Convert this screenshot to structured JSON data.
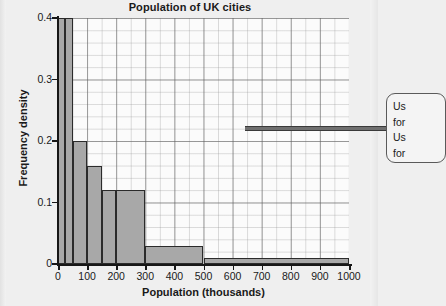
{
  "chart_data": {
    "type": "bar",
    "title": "Population of UK cities",
    "xlabel": "Population (thousands)",
    "ylabel": "Frequency density",
    "xlim": [
      0,
      1000
    ],
    "ylim": [
      0,
      0.4
    ],
    "grid": true,
    "legend": "none",
    "xticks": [
      "0",
      "100",
      "200",
      "300",
      "400",
      "500",
      "600",
      "700",
      "800",
      "900",
      "1000"
    ],
    "xtick_values": [
      0,
      100,
      200,
      300,
      400,
      500,
      600,
      700,
      800,
      900,
      1000
    ],
    "yticks": [
      "0",
      "0.1",
      "0.2",
      "0.3",
      "0.4"
    ],
    "ytick_values": [
      0,
      0.1,
      0.2,
      0.3,
      0.4
    ],
    "bins": [
      {
        "label": "0-25",
        "start": 0,
        "end": 25,
        "value": 0.4
      },
      {
        "label": "25-50",
        "start": 25,
        "end": 50,
        "value": 0.4
      },
      {
        "label": "50-100",
        "start": 50,
        "end": 100,
        "value": 0.2
      },
      {
        "label": "100-150",
        "start": 100,
        "end": 150,
        "value": 0.16
      },
      {
        "label": "150-200",
        "start": 150,
        "end": 200,
        "value": 0.12
      },
      {
        "label": "200-300",
        "start": 200,
        "end": 300,
        "value": 0.12
      },
      {
        "label": "300-500",
        "start": 300,
        "end": 500,
        "value": 0.03
      },
      {
        "label": "500-1000",
        "start": 500,
        "end": 1000,
        "value": 0.01
      }
    ],
    "categories": [
      "0-25",
      "25-50",
      "50-100",
      "100-150",
      "150-200",
      "200-300",
      "300-500",
      "500-1000"
    ],
    "values": [
      0.4,
      0.4,
      0.2,
      0.16,
      0.12,
      0.12,
      0.03,
      0.01
    ],
    "bar_fill_color": "#a8a8a8",
    "bar_edge_color": "#2b2b2b"
  },
  "callout": {
    "lines": [
      "Us",
      "for",
      "Us",
      "for"
    ]
  }
}
